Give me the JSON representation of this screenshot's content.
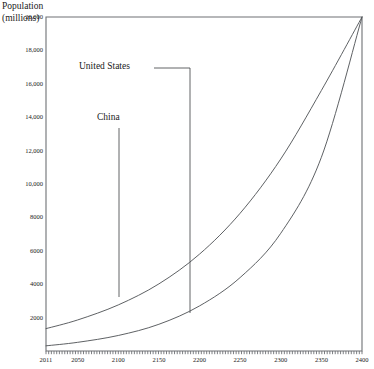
{
  "chart_data": {
    "type": "line",
    "title": "",
    "xlabel": "",
    "ylabel": "Population (millions)",
    "ylabel_line1": "Population",
    "ylabel_line2": "(millions)",
    "grid": false,
    "legend_position": "inline-annotations",
    "xlim": [
      2011,
      2400
    ],
    "ylim": [
      0,
      20000
    ],
    "xticks": [
      "2011",
      "2050",
      "2100",
      "2150",
      "2200",
      "2250",
      "2300",
      "2350",
      "2400"
    ],
    "xtick_values": [
      2011,
      2050,
      2100,
      2150,
      2200,
      2250,
      2300,
      2350,
      2400
    ],
    "yticks": [
      "2000",
      "4000",
      "6000",
      "8000",
      "10,000",
      "12,000",
      "14,000",
      "16,000",
      "18,000",
      "20,000"
    ],
    "ytick_values": [
      2000,
      4000,
      6000,
      8000,
      10000,
      12000,
      14000,
      16000,
      18000,
      20000
    ],
    "x": [
      2011,
      2050,
      2100,
      2150,
      2200,
      2250,
      2300,
      2350,
      2400
    ],
    "series": [
      {
        "name": "China",
        "color": "#55585c",
        "values": [
          1340,
          1860,
          2760,
          4020,
          5800,
          8250,
          11500,
          15600,
          20000
        ]
      },
      {
        "name": "United States",
        "color": "#55585c",
        "values": [
          310,
          520,
          930,
          1600,
          2700,
          4400,
          7050,
          11600,
          20000
        ]
      }
    ],
    "annotations": [
      {
        "label": "United States",
        "series": "United States",
        "text_x": 79,
        "text_y": 71,
        "leader_h_from_x": 154,
        "leader_h_to_x": 190,
        "leader_y": 68,
        "leader_v_to_y": 313
      },
      {
        "label": "China",
        "series": "China",
        "text_x": 97,
        "text_y": 122,
        "leader_x": 119,
        "leader_from_y": 128,
        "leader_v_to_y": 297
      }
    ],
    "axis_color": "#6e7175",
    "frame": {
      "left": 46,
      "top": 17,
      "right": 362,
      "bottom": 351
    }
  }
}
